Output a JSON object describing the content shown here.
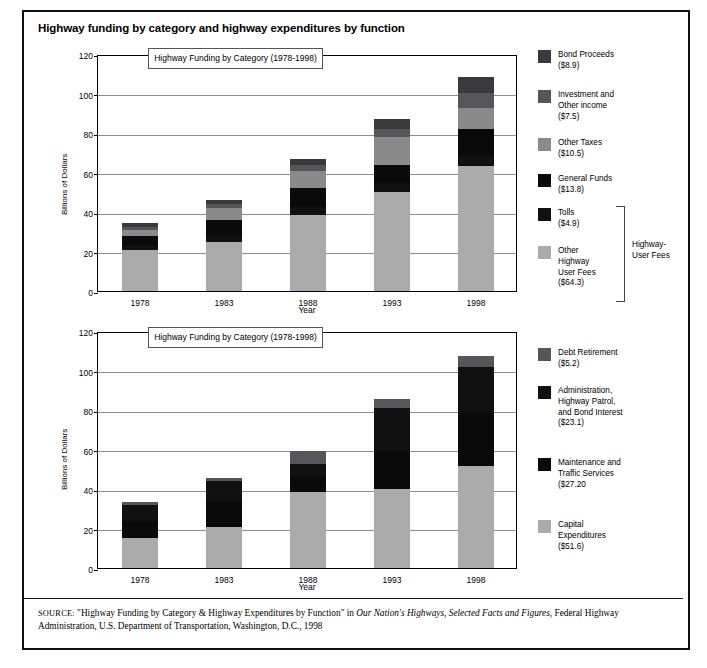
{
  "figure": {
    "title": "Highway funding by category and highway expenditures by function",
    "source_prefix": "SOURCE:",
    "source_part1": " \"Highway Funding by Category & Highway Expenditures by Function\" in ",
    "source_italic1": "Our Nation's Highways, Selected Facts and Figures",
    "source_part2": ", Federal Highway Administration, U.S. Department of Transportation, Washington, D.C., 1998"
  },
  "colors": {
    "light_gray": "#ababab",
    "mid_gray": "#8a8a8a",
    "dark_gray": "#56565a",
    "darker_gray": "#3a3a3e",
    "black": "#0a0a0a",
    "near_black": "#111111",
    "grid": "#8d8d8d"
  },
  "chart_data": [
    {
      "id": "funding",
      "type": "bar",
      "stacked": true,
      "title": "Highway Funding by Category\n(1978-1998)",
      "xlabel": "Year",
      "ylabel": "Billions of Dollars",
      "ylim": [
        0,
        120
      ],
      "yticks": [
        0,
        20,
        40,
        60,
        80,
        100,
        120
      ],
      "grid": true,
      "legend_position": "right",
      "categories": [
        "1978",
        "1983",
        "1988",
        "1993",
        "1998"
      ],
      "series": [
        {
          "name": "Other Highway User Fees",
          "label": "Other\nHighway\nUser Fees\n($64.3)",
          "total": "$64.3",
          "color": "#ababab",
          "values": [
            21.0,
            25.0,
            38.5,
            50.0,
            63.5
          ]
        },
        {
          "name": "Tolls",
          "label": "Tolls\n($4.9)",
          "total": "$4.9",
          "color": "#111111",
          "values": [
            2.0,
            3.0,
            4.0,
            4.5,
            4.9
          ]
        },
        {
          "name": "General Funds",
          "label": "General Funds\n($13.8)",
          "total": "$13.8",
          "color": "#0a0a0a",
          "values": [
            5.0,
            8.0,
            9.5,
            9.5,
            13.8
          ]
        },
        {
          "name": "Other Taxes",
          "label": "Other Taxes\n($10.5)",
          "total": "$10.5",
          "color": "#8a8a8a",
          "values": [
            3.0,
            6.0,
            9.0,
            14.0,
            10.5
          ]
        },
        {
          "name": "Investment and Other income",
          "label": "Investment and\nOther income\n($7.5)",
          "total": "$7.5",
          "color": "#56565a",
          "values": [
            1.5,
            2.0,
            3.0,
            4.0,
            7.5
          ]
        },
        {
          "name": "Bond Proceeds",
          "label": "Bond Proceeds\n($8.9)",
          "total": "$8.9",
          "color": "#3a3a3e",
          "values": [
            2.0,
            2.0,
            3.0,
            5.0,
            8.0
          ]
        }
      ],
      "totals": [
        34.5,
        46.0,
        67.0,
        87.0,
        108.2
      ],
      "bracket_label": "Highway-\nUser Fees",
      "bracket_covers": [
        "Tolls",
        "Other Highway User Fees"
      ]
    },
    {
      "id": "expenditures",
      "type": "bar",
      "stacked": true,
      "title": "Highway Funding by Category\n(1978-1998)",
      "xlabel": "Year",
      "ylabel": "Billions of Dollars",
      "ylim": [
        0,
        120
      ],
      "yticks": [
        0,
        20,
        40,
        60,
        80,
        100,
        120
      ],
      "grid": true,
      "legend_position": "right",
      "categories": [
        "1978",
        "1983",
        "1988",
        "1993",
        "1998"
      ],
      "series": [
        {
          "name": "Capital Expenditures",
          "label": "Capital\nExpenditures\n($51.6)",
          "total": "$51.6",
          "color": "#ababab",
          "values": [
            15.0,
            21.0,
            38.5,
            40.0,
            51.6
          ]
        },
        {
          "name": "Maintenance and Traffic Services",
          "label": "Maintenance and\nTraffic Services\n($27.20",
          "total": "$27.20",
          "color": "#0a0a0a",
          "values": [
            9.0,
            13.0,
            8.0,
            20.0,
            27.2
          ]
        },
        {
          "name": "Administration, Highway Patrol, and Bond Interest",
          "label": "Administration,\nHighway Patrol,\nand Bond Interest\n($23.1)",
          "total": "$23.1",
          "color": "#111111",
          "values": [
            8.0,
            10.0,
            6.0,
            21.0,
            23.1
          ]
        },
        {
          "name": "Debt Retirement",
          "label": "Debt Retirement\n($5.2)",
          "total": "$5.2",
          "color": "#56565a",
          "values": [
            1.2,
            1.5,
            6.8,
            4.8,
            5.2
          ]
        }
      ],
      "totals": [
        33.2,
        45.5,
        59.3,
        85.8,
        107.1
      ]
    }
  ]
}
